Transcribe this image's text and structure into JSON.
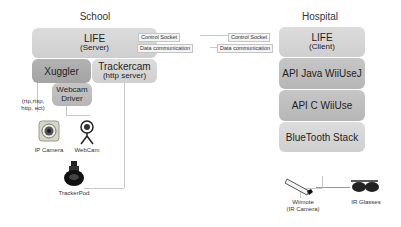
{
  "school": {
    "title": "School",
    "life": {
      "name": "LIFE",
      "role": "(Server)"
    },
    "xuggler": {
      "name": "Xuggler"
    },
    "trackercam": {
      "name": "Trackercam",
      "role": "(http server)"
    },
    "webcam_driver": {
      "line1": "Webcam",
      "line2": "Driver"
    },
    "protocols": {
      "line1": "(rtp,rtsp,",
      "line2": "http, ect)"
    },
    "devices": {
      "ip_camera": "IP Camera",
      "webcam": "WebCam",
      "trackerpod": "TrackerPod"
    }
  },
  "links": {
    "control_socket_left": "Control Socket",
    "data_comm_left": "Data communication",
    "control_socket_right": "Control Socket",
    "data_comm_right": "Data communication"
  },
  "hospital": {
    "title": "Hospital",
    "life": {
      "name": "LIFE",
      "role": "(Client)"
    },
    "api_java": {
      "name": "API Java WiiUseJ"
    },
    "api_c": {
      "name": "API C WiiUse"
    },
    "bluetooth": {
      "name": "BlueTooth Stack"
    },
    "devices": {
      "wiimote": {
        "line1": "Wiimote",
        "line2": "(IR Camera)"
      },
      "ir_glasses": "IR Glasses"
    }
  },
  "colors": {
    "box_light": "#d6d6d6",
    "box_mid": "#bebebe",
    "box_dark": "#ababab",
    "connector": "#c8c8c8"
  }
}
